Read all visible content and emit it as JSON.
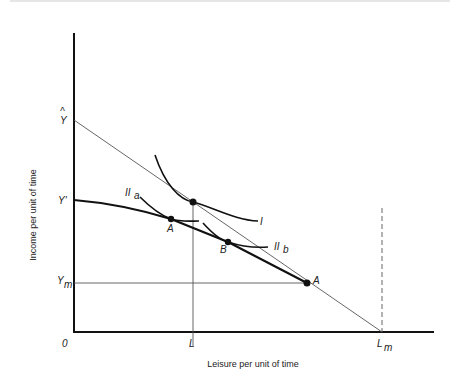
{
  "figure": {
    "x_axis_title": "Leisure per unit of time",
    "y_axis_title": "Income per unit of time",
    "origin_label": "0",
    "y_labels": {
      "y_hat": "Y",
      "y_hat_mark": "^",
      "y_prime": "Y'",
      "y_m": "Y",
      "y_m_sub": "m"
    },
    "x_labels": {
      "l": "L",
      "l_m": "L",
      "l_m_sub": "m"
    },
    "curve_labels": {
      "i": "I",
      "ii_a": "II",
      "ii_a_sub": "a",
      "ii_b": "II",
      "ii_b_sub": "b"
    },
    "point_labels": {
      "a_upper": "A",
      "b": "B",
      "a_lower": "A"
    }
  },
  "colors": {
    "ink": "#111111",
    "thin": "#555555",
    "background": "#ffffff"
  }
}
